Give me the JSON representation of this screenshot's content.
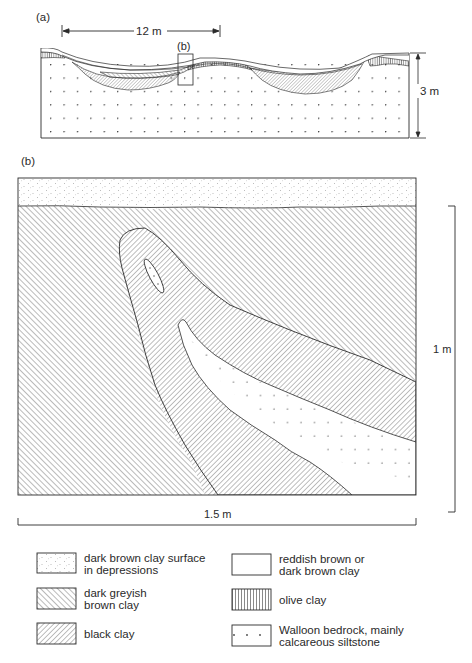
{
  "panel_a": {
    "label": "(a)",
    "width_scale": "12 m",
    "height_scale": "3 m",
    "inset_label": "(b)"
  },
  "panel_b": {
    "label": "(b)",
    "width_scale": "1.5 m",
    "height_scale": "1 m"
  },
  "legend": {
    "items": [
      {
        "pattern": "fine-stipple",
        "line1": "dark brown clay surface",
        "line2": "in depressions"
      },
      {
        "pattern": "forward-hatch",
        "line1": "dark greyish",
        "line2": "brown clay"
      },
      {
        "pattern": "back-hatch",
        "line1": "black clay",
        "line2": ""
      },
      {
        "pattern": "blank",
        "line1": "reddish brown or",
        "line2": "dark brown clay"
      },
      {
        "pattern": "vertical-lines",
        "line1": "olive clay",
        "line2": ""
      },
      {
        "pattern": "dots",
        "line1": "Walloon bedrock, mainly",
        "line2": "calcareous siltstone"
      }
    ]
  },
  "colors": {
    "ink": "#2a2a2a",
    "background": "#ffffff"
  }
}
